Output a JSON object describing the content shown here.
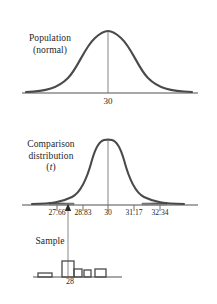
{
  "figure": {
    "background_color": "#ffffff",
    "curve_color": "#4a4a4a",
    "axis_color": "#8a8a8a",
    "text_color": "#262626",
    "shade_color": "#555555",
    "width": 217,
    "height": 304
  },
  "panels": {
    "population": {
      "label_line1": "Population",
      "label_line2": "(normal)",
      "mean_label": "30",
      "curve_type": "normal-bell",
      "axis_x_start": 22,
      "axis_x_end": 198,
      "axis_y": 93,
      "mean_x": 108
    },
    "comparison": {
      "label_line1": "Comparison",
      "label_line2": "distribution",
      "label_line3": "(t)",
      "label_symbol": "t",
      "curve_type": "t-distribution",
      "axis_x_start": 22,
      "axis_x_end": 198,
      "axis_y": 205,
      "mean_x": 108,
      "tick_labels": [
        "27.66",
        "28.83",
        "30",
        "31.17",
        "32.34"
      ],
      "tick_positions": [
        57,
        83,
        108,
        134,
        160
      ],
      "tick_label_y": 208,
      "shaded_tails": true,
      "cutoff_marker": {
        "name": "sample-mean-arrow",
        "x": 68,
        "shape": "up-triangle"
      }
    },
    "sample": {
      "label": "Sample",
      "mean_label": "28",
      "axis_x_start": 33,
      "axis_x_end": 122,
      "axis_y": 277,
      "marker_x": 68,
      "histogram_bars": [
        {
          "x": 38,
          "width": 14,
          "height": 4
        },
        {
          "x": 62,
          "width": 12,
          "height": 16
        },
        {
          "x": 74,
          "width": 8,
          "height": 8
        },
        {
          "x": 84,
          "width": 7,
          "height": 7
        },
        {
          "x": 95,
          "width": 11,
          "height": 8
        }
      ]
    }
  }
}
